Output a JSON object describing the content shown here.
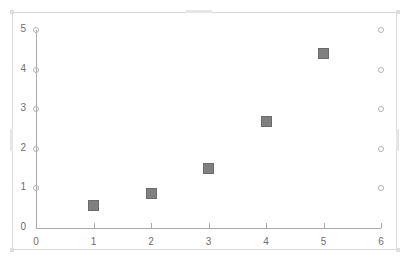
{
  "chart_data": {
    "type": "scatter",
    "title": "",
    "xlabel": "",
    "ylabel": "",
    "xlim": [
      0,
      6
    ],
    "ylim": [
      0,
      5
    ],
    "grid": false,
    "legend": null,
    "x_ticks": [
      "0",
      "1",
      "2",
      "3",
      "4",
      "5",
      "6"
    ],
    "y_ticks": [
      "0",
      "1",
      "2",
      "3",
      "4",
      "5"
    ],
    "series": [
      {
        "name": "data-points",
        "marker": "filled-square",
        "color": "#808080",
        "x": [
          1,
          2,
          3,
          4,
          5
        ],
        "values": [
          0.58,
          0.88,
          1.5,
          2.7,
          4.4
        ]
      },
      {
        "name": "y-axis-markers",
        "marker": "open-circle",
        "color": "#b2b2b2",
        "x": [
          0,
          0,
          0,
          0,
          0
        ],
        "values": [
          1,
          2,
          3,
          4,
          5
        ]
      },
      {
        "name": "right-edge-markers",
        "marker": "open-circle",
        "color": "#b2b2b2",
        "x": [
          6,
          6,
          6,
          6,
          6
        ],
        "values": [
          1,
          2,
          3,
          4,
          5
        ]
      }
    ]
  },
  "frame": {
    "border_color": "#d8d8d8",
    "handle_color": "#e6e6e6"
  }
}
